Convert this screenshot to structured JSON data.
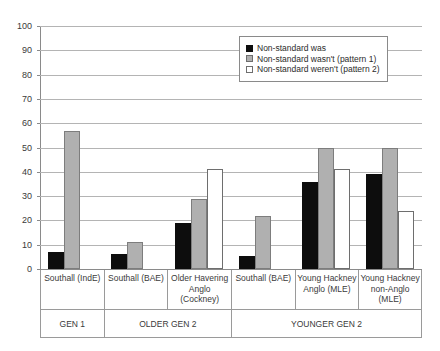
{
  "chart_data": {
    "type": "bar",
    "title": "",
    "xlabel": "",
    "ylabel": "",
    "ylim": [
      0,
      100
    ],
    "ytick_step": 10,
    "yticks": [
      100,
      90,
      80,
      70,
      60,
      50,
      40,
      30,
      20,
      10,
      0
    ],
    "grid": true,
    "legend_position": "top-right",
    "categories": [
      "Southall (IndE)",
      "Southall (BAE)",
      "Older Havering Anglo (Cockney)",
      "Southall (BAE)",
      "Young Hackney Anglo (MLE)",
      "Young Hackney non-Anglo (MLE)"
    ],
    "groups": [
      "GEN 1",
      "OLDER GEN 2",
      "YOUNGER GEN 2"
    ],
    "group_spans": [
      1,
      2,
      3
    ],
    "series": [
      {
        "name": "Non-standard was",
        "color": "#0d0d0d",
        "values": [
          7,
          6,
          19,
          5.5,
          36,
          39
        ]
      },
      {
        "name": "Non-standard wasn't (pattern 1)",
        "color": "#b0b0b0",
        "values": [
          57,
          11,
          29,
          22,
          50,
          50
        ]
      },
      {
        "name": "Non-standard weren't (pattern 2)",
        "color": "#ffffff",
        "values": [
          null,
          null,
          41,
          null,
          41,
          24
        ]
      }
    ]
  },
  "legend": {
    "items": [
      {
        "label": "Non-standard was",
        "swatch": "filled-black-square-icon"
      },
      {
        "label": "Non-standard wasn't (pattern 1)",
        "swatch": "filled-gray-square-icon"
      },
      {
        "label": "Non-standard weren't (pattern 2)",
        "swatch": "outlined-white-square-icon"
      }
    ]
  }
}
